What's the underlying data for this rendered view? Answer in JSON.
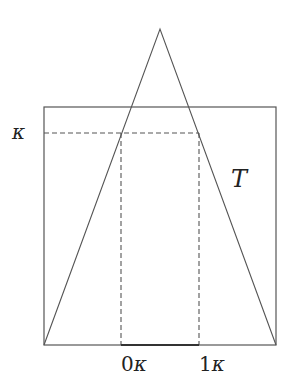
{
  "diagram": {
    "colors": {
      "line": "#555555",
      "text": "#222222",
      "background": "#ffffff"
    },
    "triangle": {
      "apex": [
        160,
        29
      ],
      "base_left": [
        44,
        345
      ],
      "base_right": [
        276,
        345
      ]
    },
    "rectangle": {
      "x": 44,
      "y": 107,
      "width": 232,
      "height": 238
    },
    "dashed_horizontal": {
      "y": 133,
      "x1": 44,
      "x2": 199
    },
    "dashed_verticals": [
      {
        "x": 121,
        "y1": 133,
        "y2": 345
      },
      {
        "x": 199,
        "y1": 133,
        "y2": 345
      }
    ],
    "labels": {
      "kappa": "κ",
      "T": "T",
      "tick_0": "0",
      "tick_1": "1",
      "tick_symbol": "κ"
    }
  }
}
